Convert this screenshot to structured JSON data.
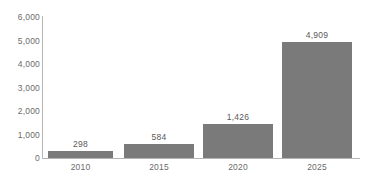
{
  "chart_data": {
    "type": "bar",
    "title": "",
    "subtitle": "",
    "xlabel": "",
    "ylabel": "",
    "categories": [
      "2010",
      "2015",
      "2020",
      "2025"
    ],
    "values": [
      298,
      584,
      1426,
      4909
    ],
    "value_labels": [
      "298",
      "584",
      "1,426",
      "4,909"
    ],
    "ylim": [
      0,
      6000
    ],
    "yticks": [
      0,
      1000,
      2000,
      3000,
      4000,
      5000,
      6000
    ],
    "ytick_labels": [
      "0",
      "1,000",
      "2,000",
      "3,000",
      "4,000",
      "5,000",
      "6,000"
    ],
    "grid": false,
    "legend": null,
    "series": [
      {
        "name": "",
        "values": [
          298,
          584,
          1426,
          4909
        ]
      }
    ]
  },
  "style": {
    "bar_color": "#7a7a7a",
    "axis_color": "#b5b5b5",
    "tick_label_color": "#6b6b6b",
    "value_label_color": "#5a5a5a",
    "background_color": "#ffffff"
  }
}
